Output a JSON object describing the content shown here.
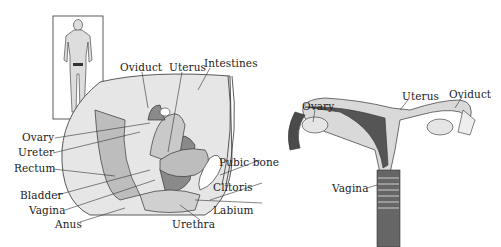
{
  "figure": {
    "left_panel": {
      "title": "Female reproductive system – sagittal section",
      "inset": "body-silhouette",
      "labels": {
        "oviduct": "Oviduct",
        "uterus": "Uterus",
        "intestines": "Intestines",
        "ovary": "Ovary",
        "ureter": "Ureter",
        "rectum": "Rectum",
        "pubic_bone": "Pubic bone",
        "bladder": "Bladder",
        "vagina": "Vagina",
        "clitoris": "Clitoris",
        "anus": "Anus",
        "labium": "Labium",
        "urethra": "Urethra"
      }
    },
    "right_panel": {
      "title": "Female reproductive system – frontal view",
      "labels": {
        "ovary": "Ovary",
        "uterus": "Uterus",
        "oviduct": "Oviduct",
        "vagina": "Vagina"
      }
    },
    "colors": {
      "light_tissue": "#d9d9d9",
      "mid_tissue": "#bdbdbd",
      "dark_tissue": "#8a8a8a",
      "darkest": "#4a4a4a",
      "outline": "#333333"
    }
  }
}
